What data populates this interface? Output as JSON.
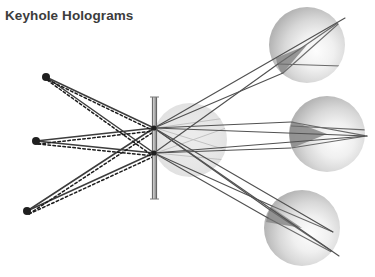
{
  "figure": {
    "title": "Keyhole Holograms",
    "title_color": "#3c3c3c",
    "background_color": "#ffffff",
    "width": 375,
    "height": 277
  },
  "diagram": {
    "type": "optical-ray-diagram",
    "colors": {
      "ray_solid": "#4a4a4a",
      "ray_dashed": "#2b2b2b",
      "source_dot": "#1f1f1f",
      "barrier": "#9a9a9a",
      "barrier_edge": "#6e6e6e",
      "sphere_light": "#fbfbfb",
      "sphere_mid": "#d2d2d2",
      "sphere_edge": "#b0b0b0",
      "sphere_cap_dark": "#8a8a8a",
      "center_sphere": "#cfcfcf"
    },
    "source_points": [
      {
        "name": "source-top",
        "x": 46,
        "y": 77,
        "r": 4.0
      },
      {
        "name": "source-middle",
        "x": 36,
        "y": 141,
        "r": 4.0
      },
      {
        "name": "source-bottom",
        "x": 27,
        "y": 211,
        "r": 4.0
      }
    ],
    "barrier": {
      "name": "keyhole-barrier",
      "x": 152,
      "y_top": 97,
      "y_bottom": 199,
      "thickness": 5
    },
    "apertures": [
      {
        "name": "keyhole-upper",
        "x": 154,
        "y": 128
      },
      {
        "name": "keyhole-lower",
        "x": 154,
        "y": 153
      }
    ],
    "center_sphere": {
      "name": "object-sphere",
      "cx": 190,
      "cy": 140,
      "r": 37,
      "opacity": 0.55
    },
    "image_spheres": [
      {
        "name": "image-sphere-top",
        "cx": 307,
        "cy": 45,
        "r": 38,
        "cap_angle": 212
      },
      {
        "name": "image-sphere-middle",
        "cx": 327,
        "cy": 134,
        "r": 38,
        "cap_angle": 182
      },
      {
        "name": "image-sphere-bottom",
        "cx": 302,
        "cy": 228,
        "r": 38,
        "cap_angle": 152
      }
    ],
    "rays": {
      "incoming_count": 6,
      "outgoing_count": 12,
      "style": "solid strokes paired with dashed overlay on incoming rays"
    }
  }
}
